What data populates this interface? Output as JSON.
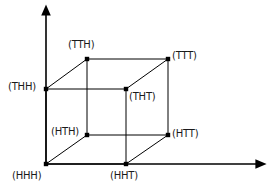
{
  "figure": {
    "type": "diagram",
    "background_color": "#ffffff",
    "line_color": "#000000",
    "text_color": "#1a1a1a",
    "axes": {
      "origin": {
        "x": 46,
        "y": 164
      },
      "vertical_axis": {
        "x1": 46,
        "y1": 164,
        "x2": 46,
        "y2": 14,
        "arrow": "up",
        "name": "vertical-axis"
      },
      "horizontal_axis": {
        "x1": 46,
        "y1": 164,
        "x2": 257,
        "y2": 164,
        "arrow": "right",
        "name": "horizontal-axis"
      }
    },
    "vertices": [
      {
        "id": "HHH",
        "label": "(HHH)",
        "x": 46,
        "y": 164,
        "label_x": 12,
        "label_y": 170,
        "label_anchor": "below-left"
      },
      {
        "id": "HHT",
        "label": "(HHT)",
        "x": 126,
        "y": 164,
        "label_x": 110,
        "label_y": 170,
        "label_anchor": "below"
      },
      {
        "id": "HTH",
        "label": "(HTH)",
        "x": 87,
        "y": 135,
        "label_x": 51,
        "label_y": 126,
        "label_anchor": "left"
      },
      {
        "id": "HTT",
        "label": "(HTT)",
        "x": 168,
        "y": 135,
        "label_x": 172,
        "label_y": 128,
        "label_anchor": "right"
      },
      {
        "id": "THH",
        "label": "(THH)",
        "x": 46,
        "y": 89,
        "label_x": 8,
        "label_y": 81,
        "label_anchor": "left"
      },
      {
        "id": "THT",
        "label": "(THT)",
        "x": 126,
        "y": 89,
        "label_x": 129,
        "label_y": 91,
        "label_anchor": "below-right"
      },
      {
        "id": "TTH",
        "label": "(TTH)",
        "x": 87,
        "y": 59,
        "label_x": 68,
        "label_y": 39,
        "label_anchor": "above"
      },
      {
        "id": "TTT",
        "label": "(TTT)",
        "x": 168,
        "y": 59,
        "label_x": 172,
        "label_y": 50,
        "label_anchor": "right"
      }
    ],
    "edges": [
      {
        "from": "HHH",
        "to": "HHT",
        "name": "edge-hhh-hht"
      },
      {
        "from": "HHH",
        "to": "THH",
        "name": "edge-hhh-thh"
      },
      {
        "from": "HHH",
        "to": "HTH",
        "name": "edge-hhh-hth"
      },
      {
        "from": "HHT",
        "to": "THT",
        "name": "edge-hht-tht"
      },
      {
        "from": "HHT",
        "to": "HTT",
        "name": "edge-hht-htt"
      },
      {
        "from": "THH",
        "to": "THT",
        "name": "edge-thh-tht"
      },
      {
        "from": "THH",
        "to": "TTH",
        "name": "edge-thh-tth"
      },
      {
        "from": "THT",
        "to": "TTT",
        "name": "edge-tht-ttt"
      },
      {
        "from": "HTH",
        "to": "HTT",
        "name": "edge-hth-htt"
      },
      {
        "from": "HTH",
        "to": "TTH",
        "name": "edge-hth-tth"
      },
      {
        "from": "HTT",
        "to": "TTT",
        "name": "edge-htt-ttt"
      },
      {
        "from": "TTH",
        "to": "TTT",
        "name": "edge-tth-ttt"
      }
    ]
  }
}
